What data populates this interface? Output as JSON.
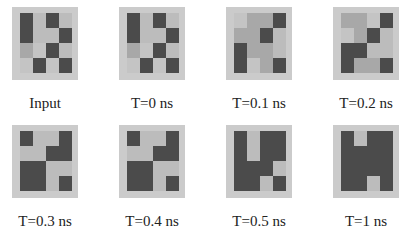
{
  "colors": {
    "frame": "#cbcbcb",
    "d": "#4b4b4b",
    "l": "#bcbcbc",
    "m": "#a8a8a8",
    "w": "#c4c4c4"
  },
  "panels": [
    {
      "label": "Input",
      "left": 0,
      "top": 7,
      "cells": [
        [
          "d",
          "l",
          "d",
          "l"
        ],
        [
          "d",
          "l",
          "l",
          "d"
        ],
        [
          "m",
          "w",
          "d",
          "l"
        ],
        [
          "w",
          "d",
          "w",
          "d"
        ]
      ]
    },
    {
      "label": "T=0 ns",
      "left": 107,
      "top": 7,
      "cells": [
        [
          "d",
          "l",
          "d",
          "l"
        ],
        [
          "d",
          "l",
          "l",
          "d"
        ],
        [
          "m",
          "w",
          "d",
          "l"
        ],
        [
          "w",
          "d",
          "w",
          "d"
        ]
      ]
    },
    {
      "label": "T=0.1 ns",
      "left": 214,
      "top": 7,
      "cells": [
        [
          "w",
          "m",
          "m",
          "d"
        ],
        [
          "m",
          "m",
          "d",
          "l"
        ],
        [
          "d",
          "m",
          "m",
          "l"
        ],
        [
          "d",
          "w",
          "m",
          "d"
        ]
      ]
    },
    {
      "label": "T=0.2 ns",
      "left": 321,
      "top": 7,
      "cells": [
        [
          "m",
          "m",
          "w",
          "d"
        ],
        [
          "w",
          "m",
          "d",
          "l"
        ],
        [
          "d",
          "d",
          "l",
          "l"
        ],
        [
          "d",
          "m",
          "m",
          "d"
        ]
      ]
    },
    {
      "label": "T=0.3 ns",
      "left": 0,
      "top": 125,
      "cells": [
        [
          "d",
          "l",
          "l",
          "d"
        ],
        [
          "l",
          "l",
          "d",
          "d"
        ],
        [
          "d",
          "d",
          "l",
          "l"
        ],
        [
          "d",
          "d",
          "l",
          "d"
        ]
      ]
    },
    {
      "label": "T=0.4 ns",
      "left": 107,
      "top": 125,
      "cells": [
        [
          "d",
          "l",
          "l",
          "d"
        ],
        [
          "l",
          "l",
          "d",
          "d"
        ],
        [
          "d",
          "d",
          "l",
          "l"
        ],
        [
          "d",
          "d",
          "l",
          "d"
        ]
      ]
    },
    {
      "label": "T=0.5 ns",
      "left": 214,
      "top": 125,
      "cells": [
        [
          "d",
          "l",
          "d",
          "d"
        ],
        [
          "d",
          "l",
          "d",
          "d"
        ],
        [
          "d",
          "d",
          "d",
          "l"
        ],
        [
          "d",
          "d",
          "l",
          "d"
        ]
      ]
    },
    {
      "label": "T=1 ns",
      "left": 321,
      "top": 125,
      "cells": [
        [
          "d",
          "l",
          "d",
          "d"
        ],
        [
          "d",
          "d",
          "d",
          "d"
        ],
        [
          "d",
          "d",
          "d",
          "d"
        ],
        [
          "d",
          "d",
          "l",
          "d"
        ]
      ]
    }
  ]
}
